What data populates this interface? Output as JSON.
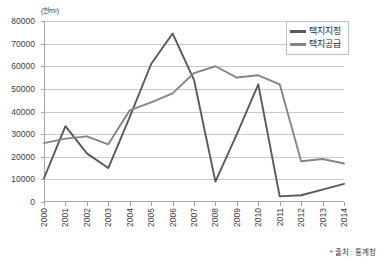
{
  "chart_data": {
    "type": "line",
    "title": "",
    "unit_label": "(천m²)",
    "xlabel": "",
    "ylabel": "",
    "categories": [
      "2000",
      "2001",
      "2002",
      "2003",
      "2004",
      "2005",
      "2006",
      "2007",
      "2008",
      "2009",
      "2010",
      "2011",
      "2012",
      "2013",
      "2014"
    ],
    "ylim": [
      0,
      80000
    ],
    "ytick_values": [
      0,
      10000,
      20000,
      30000,
      40000,
      50000,
      60000,
      70000,
      80000
    ],
    "ytick_labels": [
      "0",
      "10000",
      "20000",
      "30000",
      "40000",
      "50000",
      "60000",
      "70000",
      "80000"
    ],
    "grid": true,
    "legend_position": "top-right",
    "series": [
      {
        "name": "택지지정",
        "color": "#595959",
        "values": [
          10500,
          33500,
          21500,
          15000,
          37500,
          61000,
          74500,
          54000,
          9000,
          30000,
          52000,
          2500,
          3000,
          5500,
          8000
        ]
      },
      {
        "name": "택지공급",
        "color": "#858585",
        "values": [
          26000,
          28000,
          29000,
          25500,
          40500,
          44000,
          48000,
          57000,
          60000,
          55000,
          56000,
          52000,
          18000,
          19000,
          17000
        ]
      }
    ],
    "source_note": "* 출처 : 통계청"
  }
}
